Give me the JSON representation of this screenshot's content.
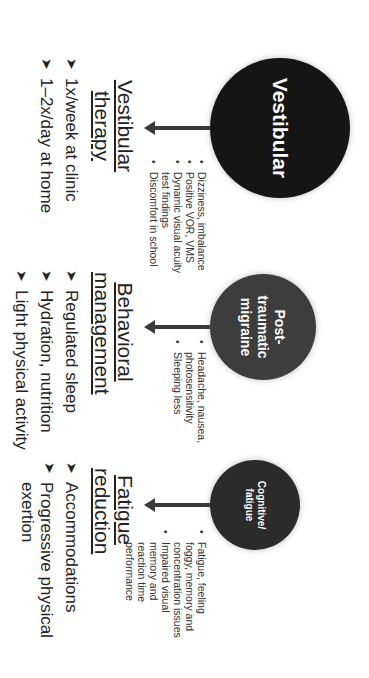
{
  "columns": [
    {
      "circle_label": "Vestibular",
      "symptoms": [
        "Dizziness, imbalance",
        "Positive VOR, VMS",
        "Dynamic visual acuity test findings",
        "Discomfort in school"
      ],
      "heading": "Vestibular therapy",
      "actions": [
        "1x/week at clinic",
        "1–2x/day at home"
      ]
    },
    {
      "circle_label": "Post-traumatic migraine",
      "symptoms": [
        "Headache, nausea, photosensitivity",
        "Sleeping less"
      ],
      "heading": "Behavioral management",
      "actions": [
        "Regulated sleep",
        "Hydration, nutrition",
        "Light physical activity"
      ]
    },
    {
      "circle_label": "Cognitive/ fatigue",
      "symptoms": [
        "Fatigue, feeling foggy, memory and concentration issues",
        "Impaired visual memory and reaction time performance"
      ],
      "heading": "Fatigue reduction",
      "actions": [
        "Accommodations",
        "Progressive physical exertion"
      ]
    }
  ],
  "bullet_glyph": "➤",
  "colors": {
    "circle1": "#151515",
    "circle2": "#3d3d3d",
    "circle3": "#2b2b2b",
    "arrow": "#3a3a3a"
  }
}
